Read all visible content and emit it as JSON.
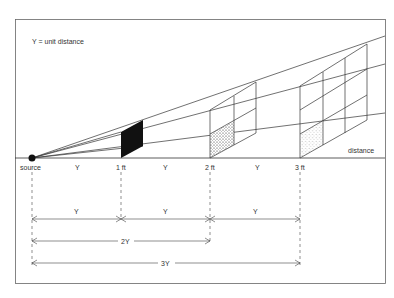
{
  "diagram": {
    "legend": "Y = unit distance",
    "source_label": "source",
    "axis_label": "distance",
    "markers": [
      {
        "label": "1 ft",
        "x": 121
      },
      {
        "label": "2 ft",
        "x": 210
      },
      {
        "label": "3 ft",
        "x": 300
      }
    ],
    "segment_labels": [
      "Y",
      "Y",
      "Y"
    ],
    "dimension_rows": [
      {
        "labels": [
          "Y",
          "Y",
          "Y"
        ]
      },
      {
        "label": "2Y"
      },
      {
        "label": "3Y"
      }
    ],
    "colors": {
      "line": "#333333",
      "frame": "#555555",
      "fill_black": "#111111"
    }
  }
}
